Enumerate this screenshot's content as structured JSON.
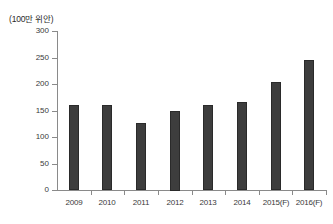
{
  "chart_data": {
    "type": "bar",
    "title": "",
    "subtitle": "",
    "unit_label": "(100만 위안)",
    "xlabel": "",
    "ylabel": "",
    "ylim": [
      0,
      300
    ],
    "yticks": [
      0,
      50,
      100,
      150,
      200,
      250,
      300
    ],
    "ytick_labels": [
      "0",
      "50",
      "100",
      "150",
      "200",
      "250",
      "300"
    ],
    "grid": false,
    "legend": null,
    "legend_position": "none",
    "categories": [
      "2009",
      "2010",
      "2011",
      "2012",
      "2013",
      "2014",
      "2015(F)",
      "2016(F)"
    ],
    "values": [
      160,
      161,
      127,
      150,
      160,
      166,
      203,
      245
    ],
    "bar_color": "#3d3d3d",
    "axis_color": "#8a8a8a",
    "text_color": "#3a3a3a",
    "background_color": "#ffffff"
  }
}
